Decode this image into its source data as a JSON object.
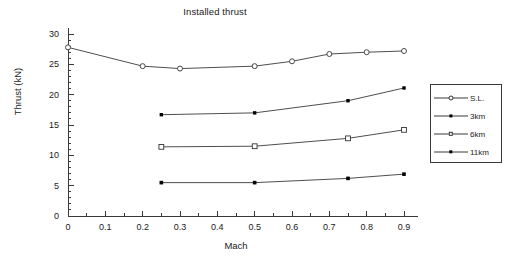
{
  "chart_data": {
    "type": "line",
    "title": "Installed thrust",
    "xlabel": "Mach",
    "ylabel": "Thrust (kN)",
    "xlim": [
      0,
      0.9
    ],
    "ylim": [
      0,
      30
    ],
    "xticks": [
      "0",
      "0.1",
      "0.2",
      "0.3",
      "0.4",
      "0.5",
      "0.6",
      "0.7",
      "0.8",
      "0.9"
    ],
    "xtick_values": [
      0,
      0.1,
      0.2,
      0.3,
      0.4,
      0.5,
      0.6,
      0.7,
      0.8,
      0.9
    ],
    "yticks": [
      "0",
      "5",
      "10",
      "15",
      "20",
      "25",
      "30"
    ],
    "ytick_values": [
      0,
      5,
      10,
      15,
      20,
      25,
      30
    ],
    "grid": false,
    "minor_ticks": true,
    "legend_position": "right-outside",
    "series": [
      {
        "name": "11km",
        "marker": "filled-square",
        "x": [
          0.25,
          0.5,
          0.75,
          0.9
        ],
        "values": [
          5.5,
          5.5,
          6.2,
          6.9
        ]
      },
      {
        "name": "6km",
        "marker": "open-square",
        "x": [
          0.25,
          0.5,
          0.75,
          0.9
        ],
        "values": [
          11.4,
          11.5,
          12.8,
          14.2
        ]
      },
      {
        "name": "3km",
        "marker": "filled-diamond",
        "x": [
          0.25,
          0.5,
          0.75,
          0.9
        ],
        "values": [
          16.7,
          17.0,
          19.0,
          21.1
        ]
      },
      {
        "name": "S.L.",
        "marker": "open-diamond",
        "x": [
          0,
          0.2,
          0.3,
          0.5,
          0.6,
          0.7,
          0.8,
          0.9
        ],
        "values": [
          27.8,
          24.7,
          24.3,
          24.7,
          25.5,
          26.7,
          27.0,
          27.2
        ]
      }
    ]
  },
  "legend": {
    "entries": [
      {
        "label": "11km"
      },
      {
        "label": "6km"
      },
      {
        "label": "3km"
      },
      {
        "label": "S.L."
      }
    ]
  },
  "colors": {
    "line": "#3a3a3a",
    "text": "#1a1a1a",
    "axis": "#3a3a3a",
    "background": "#ffffff"
  }
}
